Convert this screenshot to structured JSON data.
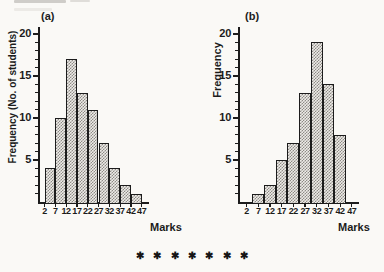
{
  "colors": {
    "ink": "#1c1c1c",
    "paper": "#faf9f6",
    "bar_fill_light": "#edebe7",
    "bar_fill_dark": "#8e8b86"
  },
  "separator": {
    "glyph": "✱",
    "count": 7
  },
  "chart_data": [
    {
      "type": "bar",
      "subtype": "histogram",
      "panel_label": "(a)",
      "title": "",
      "ylabel": "Frequency (No. of students)",
      "xlabel": "Marks",
      "x_ticks": [
        2,
        7,
        12,
        17,
        22,
        27,
        32,
        37,
        42,
        47
      ],
      "y_ticks": [
        5,
        10,
        15,
        20
      ],
      "ylim": [
        0,
        21
      ],
      "bar_alignment": "edges",
      "bin_edges": [
        2,
        7,
        12,
        17,
        22,
        27,
        32,
        37,
        42,
        47
      ],
      "values": [
        4,
        10,
        17,
        13,
        11,
        7,
        4,
        2,
        1
      ],
      "legend": "none",
      "grid": false
    },
    {
      "type": "bar",
      "subtype": "histogram",
      "panel_label": "(b)",
      "title": "",
      "ylabel": "Frequency",
      "xlabel": "Marks",
      "x_ticks": [
        2,
        7,
        12,
        17,
        22,
        27,
        32,
        37,
        42,
        47
      ],
      "y_ticks": [
        5,
        10,
        15,
        20
      ],
      "ylim": [
        0,
        21
      ],
      "bar_alignment": "centers",
      "bin_centers": [
        7,
        12,
        17,
        22,
        27,
        32,
        37,
        42
      ],
      "values": [
        1,
        2,
        5,
        7,
        13,
        19,
        14,
        8
      ],
      "legend": "none",
      "grid": false
    }
  ]
}
